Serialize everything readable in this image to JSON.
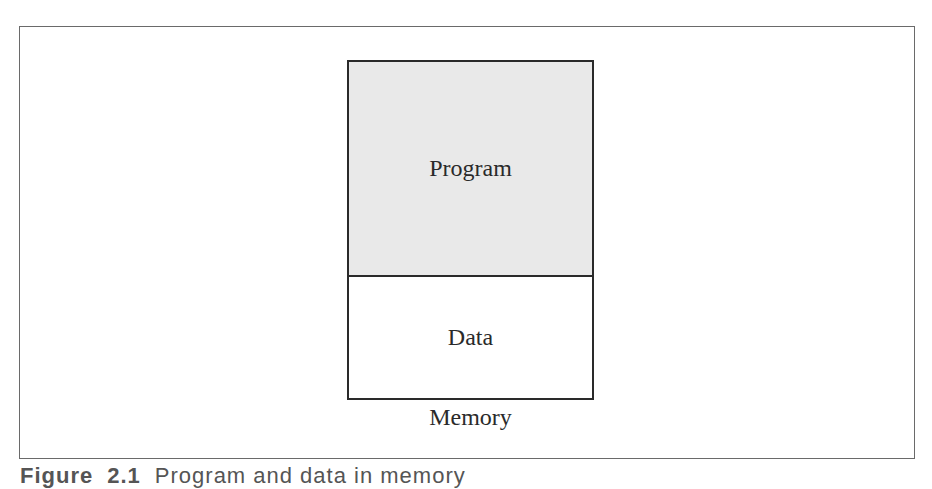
{
  "figure": {
    "segments": [
      {
        "label": "Program",
        "fill": "#e9e9e9"
      },
      {
        "label": "Data",
        "fill": "#ffffff"
      }
    ],
    "container_label": "Memory",
    "caption": {
      "prefix": "Figure",
      "number": "2.1",
      "text": "Program and data in memory"
    }
  }
}
